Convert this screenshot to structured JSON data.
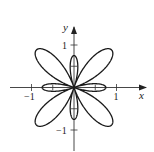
{
  "chart_data": {
    "type": "line",
    "subtype": "polar-curve",
    "title": "",
    "equation_hint": "r = 0.25 - cos(4θ)",
    "xlabel": "x",
    "ylabel": "y",
    "xlim": [
      -1.5,
      1.5
    ],
    "ylim": [
      -1.5,
      1.5
    ],
    "xticks": [
      -1,
      -0.5,
      0.5,
      1
    ],
    "yticks": [
      -1,
      -0.5,
      0.5,
      1
    ],
    "tick_labels": {
      "x": [
        "-1",
        "1"
      ],
      "y": [
        "-1",
        "1"
      ]
    },
    "grid": false,
    "legend": null,
    "features": {
      "large_petals": {
        "count": 4,
        "directions_deg": [
          45,
          135,
          225,
          315
        ],
        "radius": 1.25
      },
      "small_petals": {
        "count": 4,
        "directions_deg": [
          0,
          90,
          180,
          270
        ],
        "radius": 0.75
      }
    },
    "line_color": "#1a1a1a"
  },
  "axes": {
    "x_label": "x",
    "y_label": "y",
    "x_tick_pos": "1",
    "x_tick_neg": "−1",
    "y_tick_pos": "1",
    "y_tick_neg": "−1"
  }
}
